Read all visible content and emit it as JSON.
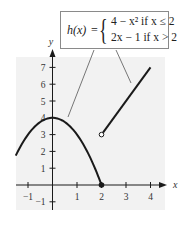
{
  "chart_data": {
    "type": "line",
    "title": "",
    "xlabel": "x",
    "ylabel": "y",
    "xlim": [
      -1.5,
      4.7
    ],
    "ylim": [
      -1.4,
      7.8
    ],
    "x_ticks": [
      -1,
      1,
      2,
      3,
      4
    ],
    "y_ticks": [
      -1,
      1,
      2,
      3,
      4,
      5,
      6,
      7
    ],
    "grid": false,
    "background": "#f2f2f2",
    "annotation": {
      "function_name": "h(x)",
      "equals": "=",
      "cases": [
        {
          "expr": "4 − x²",
          "condition": "if x ≤ 2"
        },
        {
          "expr": "2x − 1",
          "condition": "if x > 2"
        }
      ]
    },
    "series": [
      {
        "name": "4 - x^2 (x ≤ 2)",
        "type": "curve",
        "x": [
          -1.5,
          -1,
          -0.5,
          0,
          0.5,
          1,
          1.5,
          2
        ],
        "values": [
          1.75,
          3,
          3.75,
          4,
          3.75,
          3,
          1.75,
          0
        ],
        "end_point": {
          "x": 2,
          "y": 0,
          "style": "closed"
        }
      },
      {
        "name": "2x - 1 (x > 2)",
        "type": "line",
        "x": [
          2,
          4
        ],
        "values": [
          3,
          7
        ],
        "start_point": {
          "x": 2,
          "y": 3,
          "style": "open"
        }
      }
    ]
  },
  "labels": {
    "x_axis": "x",
    "y_axis": "y",
    "x_ticks": [
      "−1",
      "1",
      "2",
      "3",
      "4"
    ],
    "y_ticks": [
      "−1",
      "1",
      "2",
      "3",
      "4",
      "5",
      "6",
      "7"
    ]
  }
}
